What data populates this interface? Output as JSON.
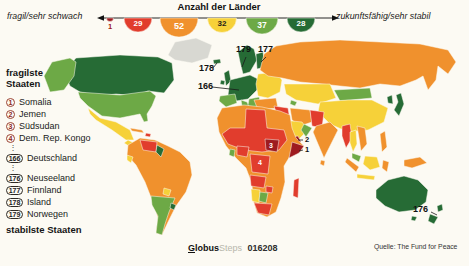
{
  "legend": {
    "title": "Anzahl der Länder",
    "left_label": "fragil/sehr schwach",
    "right_label": "zukunftsfähig/sehr stabil",
    "bins": [
      {
        "count": "1",
        "color": "#9e1b20"
      },
      {
        "count": "29",
        "color": "#e13d2d"
      },
      {
        "count": "52",
        "color": "#f0912d"
      },
      {
        "count": "32",
        "color": "#f6d139"
      },
      {
        "count": "37",
        "color": "#6da946"
      },
      {
        "count": "28",
        "color": "#266b35"
      }
    ]
  },
  "ranking": {
    "heading_top": "fragilste Staaten",
    "heading_bottom": "stabilste Staaten",
    "ellipsis": "⋮",
    "fragile": [
      {
        "rank": "1",
        "name": "Somalia"
      },
      {
        "rank": "2",
        "name": "Jemen"
      },
      {
        "rank": "3",
        "name": "Südsudan"
      },
      {
        "rank": "4",
        "name": "Dem. Rep. Kongo"
      }
    ],
    "middle": [
      {
        "rank": "166",
        "name": "Deutschland"
      }
    ],
    "stable": [
      {
        "rank": "176",
        "name": "Neuseeland"
      },
      {
        "rank": "177",
        "name": "Finnland"
      },
      {
        "rank": "178",
        "name": "Island"
      },
      {
        "rank": "179",
        "name": "Norwegen"
      }
    ]
  },
  "map": {
    "callouts": {
      "norwegen": "179",
      "finnland": "177",
      "island": "178",
      "deutschland": "166",
      "jemen": "2",
      "somalia": "1",
      "suedsudan": "3",
      "kongo": "4",
      "neuseeland": "176"
    }
  },
  "footer": {
    "brand": "Globus",
    "brand_suffix": "Steps",
    "brand_number": "016208",
    "source": "Quelle: The Fund for Peace"
  }
}
